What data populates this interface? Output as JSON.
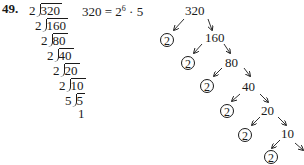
{
  "problem": {
    "number": "49.",
    "equation": "320 = 2",
    "exponent": "6",
    "equation_tail": " · 5"
  },
  "division_ladder": [
    {
      "divisor": "2",
      "dividend": "320"
    },
    {
      "divisor": "2",
      "dividend": "160"
    },
    {
      "divisor": "2",
      "dividend": "80"
    },
    {
      "divisor": "2",
      "dividend": "40"
    },
    {
      "divisor": "2",
      "dividend": "20"
    },
    {
      "divisor": "2",
      "dividend": "10"
    },
    {
      "divisor": "5",
      "dividend": "5"
    }
  ],
  "ladder_result": "1",
  "factor_tree": {
    "nodes": [
      "320",
      "160",
      "80",
      "40",
      "20",
      "10"
    ],
    "prime_leaves": [
      "2",
      "2",
      "2",
      "2",
      "2",
      "2"
    ]
  }
}
